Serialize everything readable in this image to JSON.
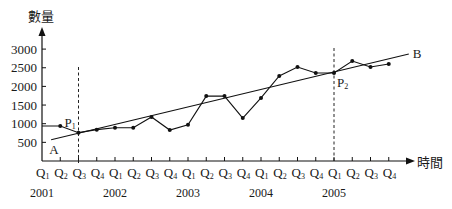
{
  "chart_data": {
    "type": "line",
    "title": "",
    "xlabel": "時間",
    "ylabel": "數量",
    "ylim": [
      0,
      3300
    ],
    "yticks": [
      500,
      1000,
      1500,
      2000,
      2500,
      3000
    ],
    "grid": false,
    "legend": null,
    "categories": [
      "2001 Q1",
      "2001 Q2",
      "2001 Q3",
      "2001 Q4",
      "2002 Q1",
      "2002 Q2",
      "2002 Q3",
      "2002 Q4",
      "2003 Q1",
      "2003 Q2",
      "2003 Q3",
      "2003 Q4",
      "2004 Q1",
      "2004 Q2",
      "2004 Q3",
      "2004 Q4",
      "2005 Q1",
      "2005 Q2",
      "2005 Q3",
      "2005 Q4"
    ],
    "quarter_labels": [
      "Q1",
      "Q2",
      "Q3",
      "Q4",
      "Q1",
      "Q2",
      "Q3",
      "Q4",
      "Q1",
      "Q2",
      "Q3",
      "Q4",
      "Q1",
      "Q2",
      "Q3",
      "Q4",
      "Q1",
      "Q2",
      "Q3",
      "Q4"
    ],
    "years": [
      "2001",
      "2002",
      "2003",
      "2004",
      "2005"
    ],
    "series": [
      {
        "name": "數量",
        "values": [
          940,
          940,
          760,
          840,
          890,
          890,
          1180,
          830,
          970,
          1740,
          1740,
          1150,
          1690,
          2280,
          2520,
          2360,
          2360,
          2680,
          2520,
          2600
        ]
      }
    ],
    "trend_line": {
      "name": "AB",
      "start_label": "A",
      "end_label": "B",
      "start": {
        "x_index": 0.5,
        "value": 570
      },
      "end": {
        "x_index": 20.1,
        "value": 2870
      }
    },
    "annotations": [
      {
        "label": "P",
        "subscript": "1",
        "x_index": 2,
        "value": 760,
        "dashed_vertical": true
      },
      {
        "label": "P",
        "subscript": "2",
        "x_index": 16,
        "value": 2360,
        "dashed_vertical": true
      }
    ]
  }
}
